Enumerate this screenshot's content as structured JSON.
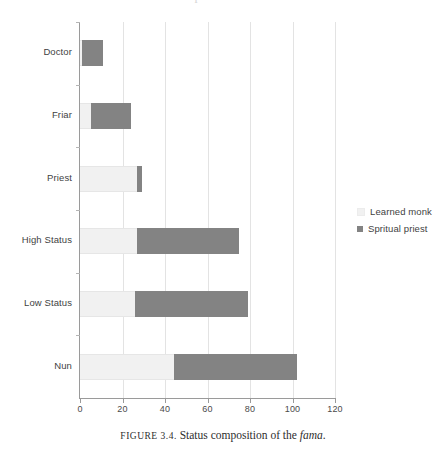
{
  "figure": {
    "caption_prefix": "FIGURE 3.4.",
    "caption_text": "Status composition of the",
    "caption_italic": "fama",
    "caption_end": ".",
    "title_remnant": "The Social Composition of the fama"
  },
  "legend": {
    "position": "right",
    "items": [
      {
        "label": "Learned monk",
        "color": "#f1f1f1"
      },
      {
        "label": "Spritual priest",
        "color": "#838383"
      }
    ]
  },
  "chart_data": {
    "type": "bar",
    "orientation": "horizontal",
    "stacked": true,
    "title": "",
    "subtitle": "",
    "xlabel": "",
    "ylabel": "",
    "xlim": [
      0,
      120
    ],
    "ylim": null,
    "grid": true,
    "xticks": [
      0,
      20,
      40,
      60,
      80,
      100,
      120
    ],
    "xtick_labels": [
      "0",
      "20",
      "40",
      "60",
      "80",
      "100",
      "120"
    ],
    "categories": [
      "Doctor",
      "Friar",
      "Priest",
      "High Status",
      "Low Status",
      "Nun"
    ],
    "series": [
      {
        "name": "Learned monk",
        "color": "#f1f1f1",
        "values": [
          1,
          5,
          27,
          27,
          26,
          44
        ]
      },
      {
        "name": "Spritual priest",
        "color": "#838383",
        "values": [
          10,
          19,
          2,
          48,
          53,
          58
        ]
      }
    ],
    "totals": [
      11,
      24,
      29,
      75,
      79,
      102
    ],
    "legend_position": "right"
  }
}
